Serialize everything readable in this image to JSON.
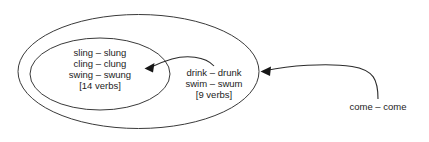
{
  "diagram": {
    "colors": {
      "ellipse_stroke": "#3a3a3a",
      "arrow_stroke": "#2b2b2b",
      "arrow_head": "#161616",
      "text": "#1c1c1c",
      "background": "#ffffff"
    },
    "inner_group": {
      "name": "inner-ellipse-group",
      "lines": [
        "sling – slung",
        "cling – clung",
        "swing – swung",
        "[14 verbs]"
      ],
      "count_label": "[14 verbs]"
    },
    "middle_group": {
      "name": "outer-ellipse-group",
      "lines": [
        "drink – drunk",
        "swim – swum",
        "[9 verbs]"
      ],
      "count_label": "[9 verbs]"
    },
    "outside_group": {
      "name": "outside-item",
      "lines": [
        "come – come"
      ]
    },
    "arrows": [
      {
        "name": "arrow-outer-to-inner",
        "from": "outer-ellipse-group",
        "to": "inner-ellipse-group",
        "direction": "left"
      },
      {
        "name": "arrow-outside-to-outer",
        "from": "outside-item",
        "to": "outer-ellipse-group",
        "direction": "left"
      }
    ]
  }
}
